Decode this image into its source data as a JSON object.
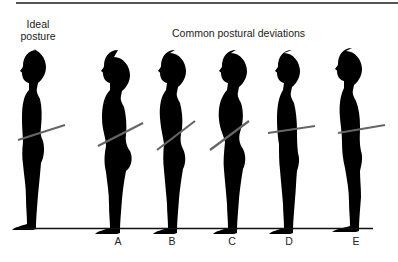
{
  "header": {
    "ideal_line1": "Ideal",
    "ideal_line2": "posture",
    "deviations_title": "Common postural deviations"
  },
  "figures": [
    {
      "id": "ideal",
      "label": "",
      "head_x": 37,
      "pelvic_tilt": "neutral"
    },
    {
      "id": "A",
      "label": "A",
      "head_x": 118,
      "pelvic_tilt": "anterior"
    },
    {
      "id": "B",
      "label": "B",
      "head_x": 175,
      "pelvic_tilt": "anterior"
    },
    {
      "id": "C",
      "label": "C",
      "head_x": 236,
      "pelvic_tilt": "anterior"
    },
    {
      "id": "D",
      "label": "D",
      "head_x": 292,
      "pelvic_tilt": "slight"
    },
    {
      "id": "E",
      "label": "E",
      "head_x": 352,
      "pelvic_tilt": "slight"
    }
  ],
  "labels": {
    "a": "A",
    "b": "B",
    "c": "C",
    "d": "D",
    "e": "E"
  },
  "colors": {
    "silhouette": "#000000",
    "pelvis_bar": "#666666",
    "rule": "#555555",
    "ground": "#111111"
  }
}
